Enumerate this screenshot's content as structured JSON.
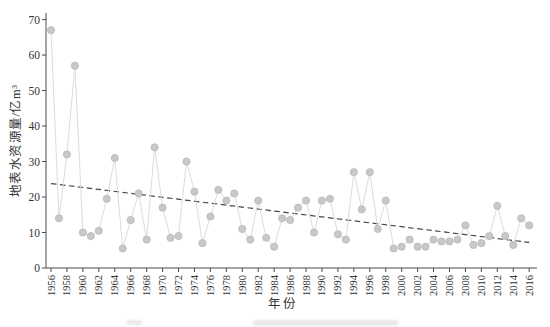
{
  "figure": {
    "background": "#ffffff",
    "caption_note": "partially cut-off faint caption at bottom edge (illegible)"
  },
  "chart_data": {
    "type": "line",
    "title": "",
    "xlabel": "年份",
    "ylabel": "地表水资源量/亿m³",
    "x_range": [
      1956,
      2016
    ],
    "xtick_step": 2,
    "ylim": [
      0,
      70
    ],
    "ytick_step": 10,
    "grid": false,
    "legend": "none",
    "years": [
      1956,
      1957,
      1958,
      1959,
      1960,
      1961,
      1962,
      1963,
      1964,
      1965,
      1966,
      1967,
      1968,
      1969,
      1970,
      1971,
      1972,
      1973,
      1974,
      1975,
      1976,
      1977,
      1978,
      1979,
      1980,
      1981,
      1982,
      1983,
      1984,
      1985,
      1986,
      1987,
      1988,
      1989,
      1990,
      1991,
      1992,
      1993,
      1994,
      1995,
      1996,
      1997,
      1998,
      1999,
      2000,
      2001,
      2002,
      2003,
      2004,
      2005,
      2006,
      2007,
      2008,
      2009,
      2010,
      2011,
      2012,
      2013,
      2014,
      2015,
      2016
    ],
    "values": [
      67,
      14,
      32,
      57,
      10,
      9,
      10.5,
      19.5,
      31,
      5.5,
      13.5,
      21,
      8,
      34,
      17,
      8.5,
      9,
      30,
      21.5,
      7,
      14.5,
      22,
      19,
      21,
      11,
      8,
      19,
      8.5,
      6,
      14,
      13.5,
      17,
      19,
      10,
      19,
      19.5,
      9.5,
      8,
      27,
      16.5,
      27,
      11,
      19,
      5.5,
      6,
      8,
      6,
      6,
      8,
      7.5,
      7.5,
      8,
      12,
      6.5,
      7,
      9,
      17.5,
      9,
      6.5,
      14,
      12
    ],
    "trend": {
      "x0": 1956,
      "y0": 23.8,
      "x1": 2016,
      "y1": 7.2,
      "style": "dashed"
    },
    "colors": {
      "dot": "#c8c8c8",
      "dot_edge": "#b9b9b9",
      "series_line": "#dcdcdc",
      "trend_line": "#474747",
      "axis": "#4a4a4a",
      "text": "#333333"
    }
  }
}
